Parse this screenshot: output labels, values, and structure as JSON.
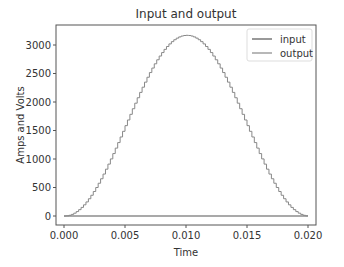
{
  "chart_data": {
    "type": "line",
    "title": "Input and output",
    "xlabel": "Time",
    "ylabel": "Amps and Volts",
    "xlim": [
      0.0,
      0.02
    ],
    "ylim": [
      -170,
      3330
    ],
    "x_ticks": [
      "0.000",
      "0.005",
      "0.010",
      "0.015",
      "0.020"
    ],
    "y_ticks": [
      "0",
      "500",
      "1000",
      "1500",
      "2000",
      "2500",
      "3000"
    ],
    "grid": false,
    "legend_position": "upper right",
    "series": [
      {
        "name": "input",
        "color": "#555555",
        "description": "flat near zero",
        "x": [
          0.0,
          0.02
        ],
        "y": [
          0,
          0
        ]
      },
      {
        "name": "output",
        "color": "#888888",
        "description": "stepped sine-squared hump peaking ~3170 at t=0.010",
        "peak": 3170,
        "peak_x": 0.01,
        "steps": 100
      }
    ]
  }
}
